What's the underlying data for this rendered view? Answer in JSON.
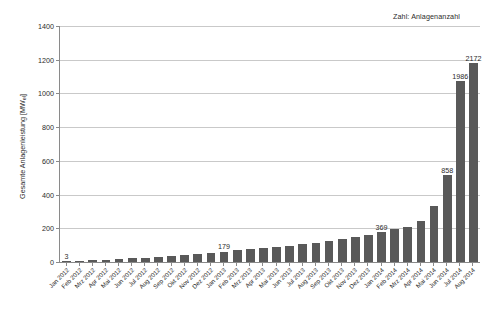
{
  "annotation": {
    "text": "Zahl: Anlagenanzahl"
  },
  "chart_data": {
    "type": "bar",
    "title": "",
    "subtitle": "",
    "xlabel": "",
    "ylabel": "Gesamte Anlagenleistung [MWel]",
    "ylabel_base": "Gesamte Anlagenleistung [MW",
    "ylabel_sub": "el",
    "ylabel_tail": "]",
    "ylim": [
      0,
      1400
    ],
    "ytick_step": 200,
    "yticks": [
      0,
      200,
      400,
      600,
      800,
      1000,
      1200,
      1400
    ],
    "ytick_labels": [
      "0",
      "200",
      "400",
      "600",
      "800",
      "1000",
      "1200",
      "1400"
    ],
    "grid": true,
    "grid_axis": "y",
    "legend": "none",
    "bar_color": "#595959",
    "axis_color": "#8a8a8a",
    "grid_color": "#c9c9c9",
    "annotation_note": "Zahl: Anlagenanzahl",
    "value_unit": "MWel",
    "label_meaning": "Anlagenanzahl",
    "categories": [
      "Jan 2012",
      "Feb 2012",
      "Mrz 2012",
      "Apr 2012",
      "Mai 2012",
      "Jun 2012",
      "Jul 2012",
      "Aug 2012",
      "Sep 2012",
      "Okt 2012",
      "Nov 2012",
      "Dez 2012",
      "Jan 2013",
      "Feb 2013",
      "Mrz 2013",
      "Apr 2013",
      "Mai 2013",
      "Jun 2013",
      "Jul 2013",
      "Aug 2013",
      "Sep 2013",
      "Okt 2013",
      "Nov 2013",
      "Dez 2013",
      "Jan 2014",
      "Feb 2014",
      "Mrz 2014",
      "Apr 2014",
      "Mai 2014",
      "Jun 2014",
      "Jul 2014",
      "Aug 2014"
    ],
    "values": [
      2,
      8,
      10,
      12,
      16,
      22,
      26,
      30,
      34,
      40,
      46,
      54,
      62,
      70,
      78,
      84,
      90,
      96,
      104,
      112,
      122,
      134,
      146,
      158,
      176,
      196,
      206,
      246,
      334,
      514,
      1074,
      1180
    ],
    "point_labels": [
      {
        "index": 0,
        "category": "Jan 2012",
        "label": "3"
      },
      {
        "index": 12,
        "category": "Jan 2013",
        "label": "179"
      },
      {
        "index": 24,
        "category": "Jan 2014",
        "label": "369"
      },
      {
        "index": 29,
        "category": "Jun 2014",
        "label": "858"
      },
      {
        "index": 30,
        "category": "Jul 2014",
        "label": "1986"
      },
      {
        "index": 31,
        "category": "Aug 2014",
        "label": "2172"
      }
    ]
  }
}
